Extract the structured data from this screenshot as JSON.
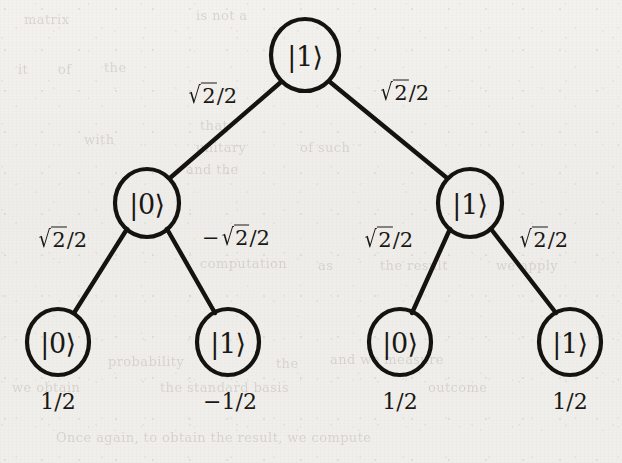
{
  "figure": {
    "name": "quantum-amplitude-binary-tree",
    "background_color": "#f1efeb",
    "ink_color": "#15130f"
  },
  "tree": {
    "root": {
      "id": "root",
      "state": "|1⟩",
      "cx": 305,
      "cy": 55,
      "rx": 34,
      "ry": 36
    },
    "level1": [
      {
        "id": "l1-left",
        "state": "|0⟩",
        "cx": 147,
        "cy": 203,
        "rx": 32,
        "ry": 34,
        "edge_label_parts": {
          "prefix": "",
          "radicand": "2",
          "denominator": "2"
        },
        "edge_label": "√2/2",
        "label_x": 212,
        "label_y": 96
      },
      {
        "id": "l1-right",
        "state": "|1⟩",
        "cx": 470,
        "cy": 203,
        "rx": 32,
        "ry": 34,
        "edge_label_parts": {
          "prefix": "",
          "radicand": "2",
          "denominator": "2"
        },
        "edge_label": "√2/2",
        "label_x": 403,
        "label_y": 93
      }
    ],
    "leaves": [
      {
        "id": "leaf-00",
        "state": "|0⟩",
        "cx": 58,
        "cy": 342,
        "rx": 31,
        "ry": 33,
        "edge_label": "√2/2",
        "edge_sign": "",
        "edge_label_x": 62,
        "edge_label_y": 240,
        "amplitude": "1/2",
        "amp_x": 58,
        "amp_y": 402
      },
      {
        "id": "leaf-01",
        "state": "|1⟩",
        "cx": 228,
        "cy": 342,
        "rx": 31,
        "ry": 33,
        "edge_label": "√2/2",
        "edge_sign": "−",
        "edge_label_x": 234,
        "edge_label_y": 238,
        "amplitude": "−1/2",
        "amp_x": 228,
        "amp_y": 402
      },
      {
        "id": "leaf-10",
        "state": "|0⟩",
        "cx": 400,
        "cy": 342,
        "rx": 31,
        "ry": 33,
        "edge_label": "√2/2",
        "edge_sign": "",
        "edge_label_x": 388,
        "edge_label_y": 240,
        "amplitude": "1/2",
        "amp_x": 400,
        "amp_y": 402
      },
      {
        "id": "leaf-11",
        "state": "|1⟩",
        "cx": 570,
        "cy": 342,
        "rx": 31,
        "ry": 33,
        "edge_label": "√2/2",
        "edge_sign": "",
        "edge_label_x": 543,
        "edge_label_y": 240,
        "amplitude": "1/2",
        "amp_x": 570,
        "amp_y": 402
      }
    ]
  },
  "ghost_text": [
    {
      "text": "matrix",
      "x": 24,
      "y": 12,
      "size": 13,
      "rot": 0
    },
    {
      "text": "is not a",
      "x": 196,
      "y": 8,
      "size": 13,
      "rot": 0
    },
    {
      "text": "it",
      "x": 18,
      "y": 62,
      "size": 13,
      "rot": 0
    },
    {
      "text": "of",
      "x": 58,
      "y": 62,
      "size": 13,
      "rot": 0
    },
    {
      "text": "the",
      "x": 104,
      "y": 60,
      "size": 13,
      "rot": 0
    },
    {
      "text": "that",
      "x": 200,
      "y": 118,
      "size": 13,
      "rot": 0
    },
    {
      "text": "with",
      "x": 84,
      "y": 132,
      "size": 13,
      "rot": 0
    },
    {
      "text": "unitary",
      "x": 196,
      "y": 140,
      "size": 13,
      "rot": 0
    },
    {
      "text": "and the",
      "x": 186,
      "y": 162,
      "size": 13,
      "rot": 0
    },
    {
      "text": "of such",
      "x": 300,
      "y": 140,
      "size": 13,
      "rot": 0
    },
    {
      "text": "computation",
      "x": 200,
      "y": 256,
      "size": 13,
      "rot": 0
    },
    {
      "text": "as",
      "x": 318,
      "y": 258,
      "size": 13,
      "rot": 0
    },
    {
      "text": "the result",
      "x": 380,
      "y": 258,
      "size": 13,
      "rot": 0
    },
    {
      "text": "we apply",
      "x": 496,
      "y": 258,
      "size": 13,
      "rot": 0
    },
    {
      "text": "probability",
      "x": 108,
      "y": 354,
      "size": 13,
      "rot": 0
    },
    {
      "text": "the",
      "x": 276,
      "y": 356,
      "size": 13,
      "rot": 0
    },
    {
      "text": "and we measure",
      "x": 330,
      "y": 352,
      "size": 13,
      "rot": 0
    },
    {
      "text": "we obtain",
      "x": 12,
      "y": 380,
      "size": 13,
      "rot": 0
    },
    {
      "text": "the standard basis",
      "x": 160,
      "y": 380,
      "size": 13,
      "rot": 0
    },
    {
      "text": "outcome",
      "x": 428,
      "y": 380,
      "size": 13,
      "rot": 0
    },
    {
      "text": "Once again, to obtain the result, we compute",
      "x": 56,
      "y": 430,
      "size": 13,
      "rot": 0
    }
  ]
}
